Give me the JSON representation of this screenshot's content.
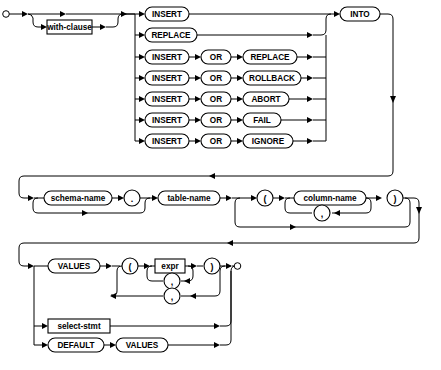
{
  "diagram": {
    "type": "railroad-syntax-diagram",
    "colors": {
      "background": "#ffffff",
      "stroke": "#000000",
      "fill": "#ffffff"
    },
    "nonterminals": {
      "with_clause": "with-clause",
      "schema_name": "schema-name",
      "table_name": "table-name",
      "column_name": "column-name",
      "expr": "expr",
      "select_stmt": "select-stmt"
    },
    "keywords": {
      "insert": "INSERT",
      "replace": "REPLACE",
      "or": "OR",
      "rollback": "ROLLBACK",
      "abort": "ABORT",
      "fail": "FAIL",
      "ignore": "IGNORE",
      "into": "INTO",
      "values": "VALUES",
      "default": "DEFAULT"
    },
    "punctuation": {
      "dot": ".",
      "comma": ",",
      "lparen": "(",
      "rparen": ")"
    },
    "branches": {
      "prefix": [
        {
          "id": "b1",
          "tokens": [
            "INSERT"
          ]
        },
        {
          "id": "b2",
          "tokens": [
            "REPLACE"
          ]
        },
        {
          "id": "b3",
          "tokens": [
            "INSERT",
            "OR",
            "REPLACE"
          ]
        },
        {
          "id": "b4",
          "tokens": [
            "INSERT",
            "OR",
            "ROLLBACK"
          ]
        },
        {
          "id": "b5",
          "tokens": [
            "INSERT",
            "OR",
            "ABORT"
          ]
        },
        {
          "id": "b6",
          "tokens": [
            "INSERT",
            "OR",
            "FAIL"
          ]
        },
        {
          "id": "b7",
          "tokens": [
            "INSERT",
            "OR",
            "IGNORE"
          ]
        }
      ],
      "tail": [
        {
          "id": "t1",
          "tokens": [
            "VALUES",
            "(",
            "expr",
            ")"
          ]
        },
        {
          "id": "t2",
          "tokens": [
            "select-stmt"
          ]
        },
        {
          "id": "t3",
          "tokens": [
            "DEFAULT",
            "VALUES"
          ]
        }
      ]
    }
  }
}
